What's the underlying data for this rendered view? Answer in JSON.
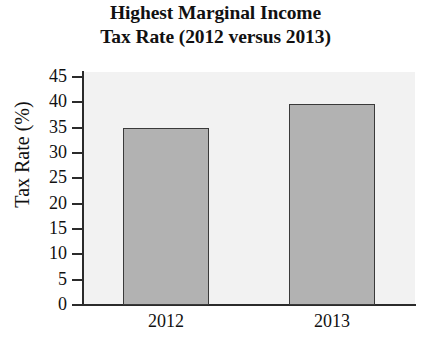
{
  "chart_data": {
    "type": "bar",
    "title": "Highest Marginal Income Tax Rate (2012 versus 2013)",
    "title_lines": [
      "Highest Marginal Income",
      "Tax Rate (2012 versus 2013)"
    ],
    "categories": [
      "2012",
      "2013"
    ],
    "values": [
      35,
      39.6
    ],
    "xlabel": "",
    "ylabel": "Tax Rate (%)",
    "ylim": [
      0,
      46
    ],
    "yticks": [
      0,
      5,
      10,
      15,
      20,
      25,
      30,
      35,
      40,
      45
    ],
    "ytick_labels": [
      "0",
      "5",
      "10",
      "15",
      "20",
      "25",
      "30",
      "35",
      "40",
      "45"
    ],
    "grid": false,
    "legend": null,
    "colors": {
      "bar_fill": "#b2b2b2",
      "bar_edge": "#3a3a3a",
      "plot_background": "#f2f2f2",
      "figure_background": "#ffffff",
      "axis": "#2b2b2b",
      "text": "#111111"
    }
  }
}
